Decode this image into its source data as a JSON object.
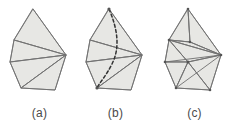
{
  "figure": {
    "background_color": "#ffffff",
    "face_fill_color": "#e7e7e4",
    "edge_color": "#6f6f6f",
    "geodesic_color": "#333333",
    "caption_color": "#4a4a4a",
    "width": 238,
    "height": 124,
    "panels": [
      {
        "id": "a",
        "caption": "(a)",
        "description": "triangulated polygonal surface with fan triangulation",
        "vertices": {
          "apex": [
            33,
            9
          ],
          "upper_left": [
            14,
            40
          ],
          "mid_left": [
            10,
            62
          ],
          "lower_left": [
            21,
            88
          ],
          "bottom": [
            55,
            90
          ],
          "right_hub": [
            66,
            55
          ],
          "upper_right": [
            60,
            39
          ]
        },
        "outline": [
          [
            33,
            9
          ],
          [
            66,
            55
          ],
          [
            55,
            90
          ],
          [
            21,
            88
          ],
          [
            10,
            62
          ],
          [
            14,
            40
          ]
        ],
        "edges": [
          [
            [
              33,
              9
            ],
            [
              14,
              40
            ]
          ],
          [
            [
              33,
              9
            ],
            [
              66,
              55
            ]
          ],
          [
            [
              14,
              40
            ],
            [
              66,
              55
            ]
          ],
          [
            [
              14,
              40
            ],
            [
              10,
              62
            ]
          ],
          [
            [
              10,
              62
            ],
            [
              66,
              55
            ]
          ],
          [
            [
              10,
              62
            ],
            [
              21,
              88
            ]
          ],
          [
            [
              21,
              88
            ],
            [
              66,
              55
            ]
          ],
          [
            [
              21,
              88
            ],
            [
              55,
              90
            ]
          ],
          [
            [
              55,
              90
            ],
            [
              66,
              55
            ]
          ]
        ],
        "geodesic": null,
        "triangle_count": 4
      },
      {
        "id": "b",
        "caption": "(b)",
        "description": "same triangulated surface with a dashed geodesic curve from apex to lower-left vertex",
        "vertices": {
          "apex": [
            33,
            9
          ],
          "upper_left": [
            14,
            40
          ],
          "mid_left": [
            10,
            62
          ],
          "lower_left": [
            21,
            88
          ],
          "bottom": [
            55,
            90
          ],
          "right_hub": [
            66,
            55
          ]
        },
        "outline": [
          [
            33,
            9
          ],
          [
            66,
            55
          ],
          [
            55,
            90
          ],
          [
            21,
            88
          ],
          [
            10,
            62
          ],
          [
            14,
            40
          ]
        ],
        "edges": [
          [
            [
              33,
              9
            ],
            [
              14,
              40
            ]
          ],
          [
            [
              33,
              9
            ],
            [
              66,
              55
            ]
          ],
          [
            [
              14,
              40
            ],
            [
              66,
              55
            ]
          ],
          [
            [
              14,
              40
            ],
            [
              10,
              62
            ]
          ],
          [
            [
              10,
              62
            ],
            [
              66,
              55
            ]
          ],
          [
            [
              10,
              62
            ],
            [
              21,
              88
            ]
          ],
          [
            [
              21,
              88
            ],
            [
              66,
              55
            ]
          ],
          [
            [
              21,
              88
            ],
            [
              55,
              90
            ]
          ],
          [
            [
              55,
              90
            ],
            [
              66,
              55
            ]
          ]
        ],
        "geodesic": {
          "type": "dashed-curve",
          "from": [
            33,
            9
          ],
          "to": [
            21,
            88
          ],
          "path": "M 33 9 C 42 30, 44 48, 36 64 C 30 76, 24 82, 21 88"
        },
        "triangle_count": 4
      },
      {
        "id": "c",
        "caption": "(c)",
        "description": "refined triangulation with an added interior vertex and extra diagonals",
        "vertices": {
          "apex": [
            33,
            9
          ],
          "upper_left": [
            14,
            40
          ],
          "mid_left": [
            10,
            62
          ],
          "lower_left": [
            21,
            88
          ],
          "bottom": [
            55,
            90
          ],
          "right_hub": [
            66,
            55
          ],
          "interior": [
            33,
            62
          ],
          "upper_mid": [
            35,
            42
          ]
        },
        "outline": [
          [
            33,
            9
          ],
          [
            66,
            55
          ],
          [
            55,
            90
          ],
          [
            21,
            88
          ],
          [
            10,
            62
          ],
          [
            14,
            40
          ]
        ],
        "edges": [
          [
            [
              33,
              9
            ],
            [
              14,
              40
            ]
          ],
          [
            [
              33,
              9
            ],
            [
              66,
              55
            ]
          ],
          [
            [
              33,
              9
            ],
            [
              35,
              42
            ]
          ],
          [
            [
              14,
              40
            ],
            [
              66,
              55
            ]
          ],
          [
            [
              14,
              40
            ],
            [
              10,
              62
            ]
          ],
          [
            [
              14,
              40
            ],
            [
              33,
              62
            ]
          ],
          [
            [
              10,
              62
            ],
            [
              66,
              55
            ]
          ],
          [
            [
              10,
              62
            ],
            [
              21,
              88
            ]
          ],
          [
            [
              10,
              62
            ],
            [
              33,
              62
            ]
          ],
          [
            [
              21,
              88
            ],
            [
              66,
              55
            ]
          ],
          [
            [
              21,
              88
            ],
            [
              55,
              90
            ]
          ],
          [
            [
              21,
              88
            ],
            [
              33,
              62
            ]
          ],
          [
            [
              55,
              90
            ],
            [
              66,
              55
            ]
          ],
          [
            [
              55,
              90
            ],
            [
              33,
              62
            ]
          ],
          [
            [
              66,
              55
            ],
            [
              33,
              62
            ]
          ],
          [
            [
              35,
              42
            ],
            [
              14,
              40
            ]
          ],
          [
            [
              35,
              42
            ],
            [
              66,
              55
            ]
          ]
        ],
        "geodesic": null,
        "triangle_count": 9
      }
    ]
  }
}
